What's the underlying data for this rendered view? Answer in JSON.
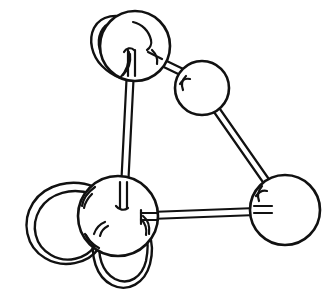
{
  "figure": {
    "title": "Ball-and-stick molecular model",
    "style": "line drawing",
    "background_color": "#ffffff",
    "stroke_color": "#111111",
    "canvas": {
      "width": 332,
      "height": 304
    }
  },
  "chart_data": {
    "type": "diagram",
    "title": "Ball-and-stick molecular model",
    "subtitle": "",
    "xlabel": "",
    "ylabel": "",
    "grid": false,
    "legend": "none",
    "nodes": [
      {
        "id": "atom-top",
        "label": "",
        "shape": "circle",
        "cx": 135,
        "cy": 46,
        "r": 35,
        "fill": "#ffffff",
        "stroke": "#111111"
      },
      {
        "id": "atom-upper-right",
        "label": "",
        "shape": "circle",
        "cx": 202,
        "cy": 88,
        "r": 27,
        "fill": "#ffffff",
        "stroke": "#111111"
      },
      {
        "id": "atom-lower-left",
        "label": "",
        "shape": "circle",
        "cx": 118,
        "cy": 216,
        "r": 40,
        "fill": "#ffffff",
        "stroke": "#111111"
      },
      {
        "id": "atom-right",
        "label": "",
        "shape": "circle",
        "cx": 285,
        "cy": 210,
        "r": 35,
        "fill": "#ffffff",
        "stroke": "#111111"
      }
    ],
    "bonds": [
      {
        "id": "bond-top-to-lower-left",
        "from": "atom-top",
        "to": "atom-lower-left",
        "style": "double-line-rod",
        "x1": 131,
        "y1": 52,
        "x2": 123,
        "y2": 206
      },
      {
        "id": "bond-top-to-upper-right",
        "from": "atom-top",
        "to": "atom-upper-right",
        "style": "double-line-rod",
        "x1": 148,
        "y1": 56,
        "x2": 199,
        "y2": 80
      },
      {
        "id": "bond-upper-right-to-right",
        "from": "atom-upper-right",
        "to": "atom-right",
        "style": "double-line-rod",
        "x1": 203,
        "y1": 94,
        "x2": 277,
        "y2": 200
      },
      {
        "id": "bond-lower-left-to-right",
        "from": "atom-lower-left",
        "to": "atom-right",
        "style": "double-line-rod",
        "x1": 128,
        "y1": 218,
        "x2": 280,
        "y2": 213
      }
    ],
    "loops": [
      {
        "id": "loop-top-upper-left",
        "on": "atom-top",
        "shape": "narrow-teardrop",
        "orientation": "upper-left",
        "description": "Elongated narrow loop rising from the upper-left of the top sphere"
      },
      {
        "id": "loop-lower-left-west",
        "on": "atom-lower-left",
        "shape": "large-circle",
        "orientation": "left",
        "description": "Large circular loop attached to the left side of the lower-left sphere"
      },
      {
        "id": "loop-lower-left-south",
        "on": "atom-lower-left",
        "shape": "u-loop",
        "orientation": "bottom",
        "description": "U-shaped loop hanging below the lower-left sphere"
      }
    ],
    "counts": {
      "atoms": 4,
      "bonds": 4,
      "loops": 3
    }
  }
}
